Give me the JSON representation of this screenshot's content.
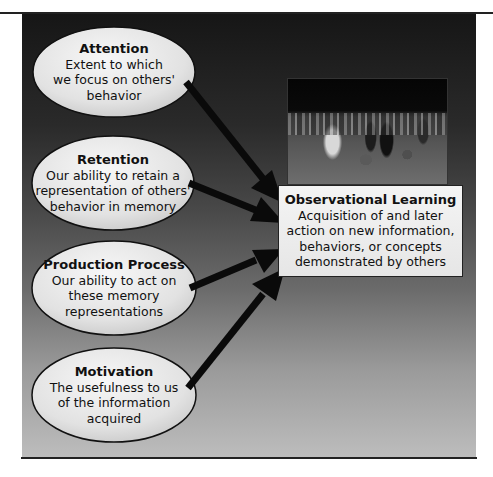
{
  "diagram": {
    "colors": {
      "background_top": "#161616",
      "background_bottom": "#bdbdbd",
      "bubble_fill": "#e8e8e8",
      "arrow": "#0a0a0a",
      "box_fill": "#f0f0f0"
    },
    "inputs": [
      {
        "title": "Attention",
        "lines": [
          "Extent to which",
          "we focus on others'",
          "behavior"
        ]
      },
      {
        "title": "Retention",
        "lines": [
          "Our ability to retain a",
          "representation of others'",
          "behavior in memory"
        ]
      },
      {
        "title": "Production Process",
        "lines": [
          "Our ability to act on",
          "these memory",
          "representations"
        ]
      },
      {
        "title": "Motivation",
        "lines": [
          "The usefulness to us",
          "of the information",
          "acquired"
        ]
      }
    ],
    "result": {
      "title": "Observational Learning",
      "lines": [
        "Acquisition of and later",
        "action on new information,",
        "behaviors, or concepts",
        "demonstrated by others"
      ]
    },
    "photo": {
      "description": "children-playing-ball-photo"
    }
  }
}
